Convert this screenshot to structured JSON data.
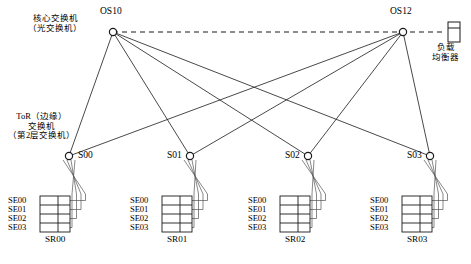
{
  "diagram": {
    "core_label": {
      "line1": "核心交换机",
      "line2": "（光交换机）"
    },
    "tor_label": {
      "line1": "ToR（边缘）",
      "line2": "交换机",
      "line3": "（第2层交换机）"
    },
    "load_balancer": {
      "label_line1": "负载",
      "label_line2": "均衡器",
      "icon": "load-balancer-icon"
    },
    "core_switches": [
      {
        "id": "OS10",
        "x": 113,
        "y": 32,
        "label_x": 100,
        "label_y": 6
      },
      {
        "id": "OS12",
        "x": 403,
        "y": 32,
        "label_x": 390,
        "label_y": 6
      }
    ],
    "tor_switches": [
      {
        "id": "S00",
        "x": 69,
        "y": 156,
        "label_x": 78,
        "label_y": 150,
        "label_side": "right"
      },
      {
        "id": "S01",
        "x": 190,
        "y": 156,
        "label_x": 167,
        "label_y": 150,
        "label_side": "left"
      },
      {
        "id": "S02",
        "x": 308,
        "y": 156,
        "label_x": 285,
        "label_y": 150,
        "label_side": "left"
      },
      {
        "id": "S03",
        "x": 430,
        "y": 156,
        "label_x": 407,
        "label_y": 150,
        "label_side": "left"
      }
    ],
    "racks": [
      {
        "id": "SR00",
        "x": 40,
        "y": 196,
        "servers": [
          "SE00",
          "SE01",
          "SE02",
          "SE03"
        ]
      },
      {
        "id": "SR01",
        "x": 162,
        "y": 196,
        "servers": [
          "SE00",
          "SE01",
          "SE02",
          "SE03"
        ]
      },
      {
        "id": "SR02",
        "x": 280,
        "y": 196,
        "servers": [
          "SE00",
          "SE01",
          "SE02",
          "SE03"
        ]
      },
      {
        "id": "SR03",
        "x": 402,
        "y": 196,
        "servers": [
          "SE00",
          "SE01",
          "SE02",
          "SE03"
        ]
      }
    ],
    "links": {
      "core_to_core": {
        "style": "dashed",
        "from": "OS10",
        "to": "OS12"
      },
      "core_to_tor": [
        {
          "from": "OS10",
          "to": "S00"
        },
        {
          "from": "OS10",
          "to": "S01"
        },
        {
          "from": "OS10",
          "to": "S02"
        },
        {
          "from": "OS10",
          "to": "S03"
        },
        {
          "from": "OS12",
          "to": "S00"
        },
        {
          "from": "OS12",
          "to": "S01"
        },
        {
          "from": "OS12",
          "to": "S02"
        },
        {
          "from": "OS12",
          "to": "S03"
        }
      ]
    },
    "colors": {
      "line": "#1a1a1a",
      "node_fill": "#ffffff",
      "rack_fill": "#ffffff",
      "text": "#000000"
    }
  }
}
